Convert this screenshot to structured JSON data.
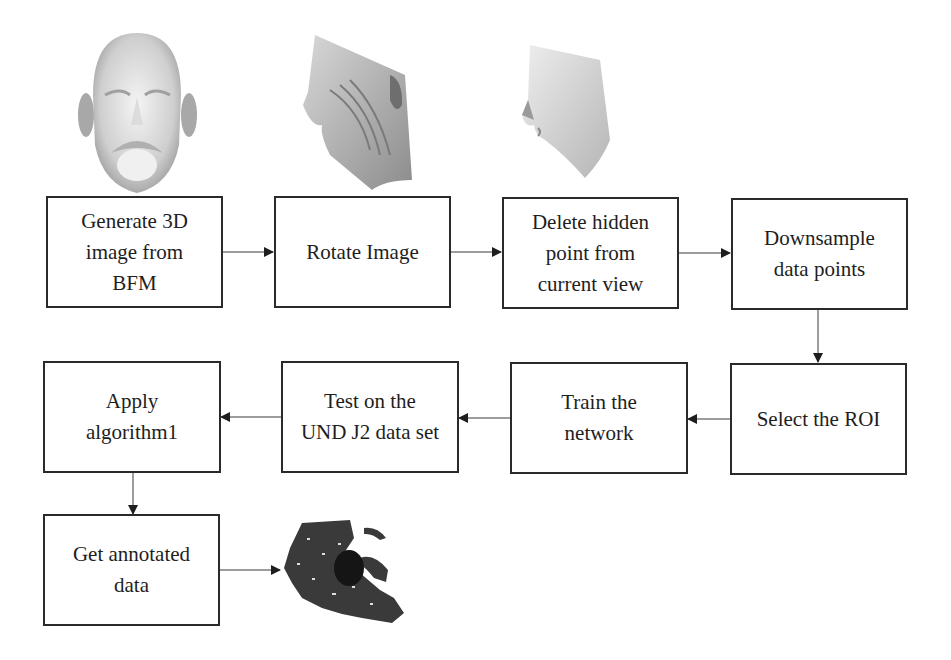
{
  "diagram": {
    "type": "flowchart",
    "steps": [
      {
        "id": "s1",
        "label": "Generate 3D\nimage from\nBFM"
      },
      {
        "id": "s2",
        "label": "Rotate Image"
      },
      {
        "id": "s3",
        "label": "Delete hidden\npoint from\ncurrent view"
      },
      {
        "id": "s4",
        "label": "Downsample\ndata points"
      },
      {
        "id": "s5",
        "label": "Select the ROI"
      },
      {
        "id": "s6",
        "label": "Train the\nnetwork"
      },
      {
        "id": "s7",
        "label": "Test on the\nUND J2 data set"
      },
      {
        "id": "s8",
        "label": "Apply\nalgorithm1"
      },
      {
        "id": "s9",
        "label": "Get annotated\ndata"
      }
    ],
    "edges": [
      {
        "from": "s1",
        "to": "s2"
      },
      {
        "from": "s2",
        "to": "s3"
      },
      {
        "from": "s3",
        "to": "s4"
      },
      {
        "from": "s4",
        "to": "s5"
      },
      {
        "from": "s5",
        "to": "s6"
      },
      {
        "from": "s6",
        "to": "s7"
      },
      {
        "from": "s7",
        "to": "s8"
      },
      {
        "from": "s8",
        "to": "s9"
      },
      {
        "from": "s9",
        "to": "annotated-point-cloud"
      }
    ],
    "images": [
      {
        "id": "frontal-face",
        "description": "3D face point cloud, frontal view"
      },
      {
        "id": "rotated-face",
        "description": "3D face point cloud, rotated profile view"
      },
      {
        "id": "visible-face",
        "description": "face profile after hidden point removal"
      },
      {
        "id": "annotated-point-cloud",
        "description": "dark annotated point cloud with highlighted region"
      }
    ],
    "colors": {
      "border": "#2a2a2a",
      "arrow": "#1e1e1e",
      "point_cloud": "#3a3a3a",
      "highlight_region": "#151515",
      "face_shade": "#9a9a9a"
    }
  }
}
